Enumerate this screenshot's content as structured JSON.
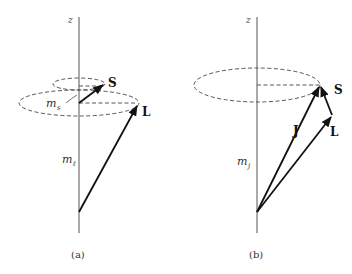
{
  "diagram": {
    "panel_a": {
      "caption": "(a)",
      "axis_label": "z",
      "vectors": {
        "S": "S",
        "L": "L"
      },
      "projections": {
        "ms_main": "m",
        "ms_sub": "s",
        "ml_main": "m",
        "ml_sub": "ℓ"
      }
    },
    "panel_b": {
      "caption": "(b)",
      "axis_label": "z",
      "vectors": {
        "J": "J",
        "S": "S",
        "L": "L"
      },
      "projections": {
        "mj_main": "m",
        "mj_sub": "j"
      }
    },
    "colors": {
      "vector": "#111111",
      "axis": "#555555",
      "dashed": "#444444",
      "background": "#ffffff"
    }
  }
}
